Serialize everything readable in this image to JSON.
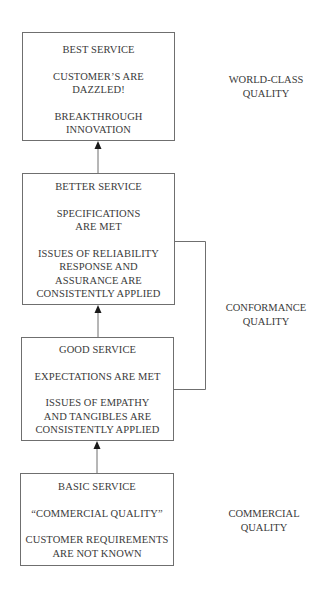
{
  "diagram": {
    "boxes": [
      {
        "id": "best",
        "title": "BEST SERVICE",
        "lines_a": [
          "CUSTOMER’S ARE",
          "DAZZLED!"
        ],
        "lines_b": [
          "BREAKTHROUGH",
          "INNOVATION"
        ]
      },
      {
        "id": "better",
        "title": "BETTER SERVICE",
        "lines_a": [
          "SPECIFICATIONS",
          "ARE MET"
        ],
        "lines_b": [
          "ISSUES OF RELIABILITY",
          "RESPONSE AND",
          "ASSURANCE ARE",
          "CONSISTENTLY APPLIED"
        ]
      },
      {
        "id": "good",
        "title": "GOOD SERVICE",
        "lines_a": [
          "EXPECTATIONS ARE MET"
        ],
        "lines_b": [
          "ISSUES OF EMPATHY",
          "AND TANGIBLES ARE",
          "CONSISTENTLY APPLIED"
        ]
      },
      {
        "id": "basic",
        "title": "BASIC SERVICE",
        "lines_a": [
          "“COMMERCIAL QUALITY”"
        ],
        "lines_b": [
          "CUSTOMER REQUIREMENTS",
          "ARE NOT KNOWN"
        ]
      }
    ],
    "quality_labels": [
      {
        "id": "world-class",
        "lines": [
          "WORLD-CLASS",
          "QUALITY"
        ]
      },
      {
        "id": "conformance",
        "lines": [
          "CONFORMANCE",
          "QUALITY"
        ]
      },
      {
        "id": "commercial",
        "lines": [
          "COMMERCIAL",
          "QUALITY"
        ]
      }
    ],
    "colors": {
      "line": "#6f6f6f",
      "arrow": "#1a1a1a",
      "text": "#3a3a3a"
    }
  }
}
